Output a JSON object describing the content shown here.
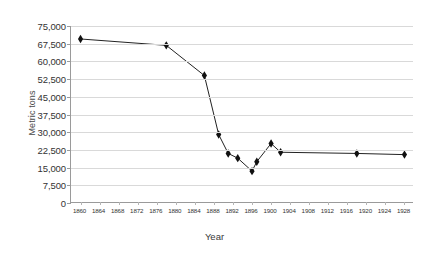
{
  "chart_data": {
    "type": "line",
    "title": "",
    "subtitle": "",
    "xlabel": "Year",
    "ylabel": "Metric tons",
    "xlim": [
      1858,
      1930
    ],
    "ylim": [
      0,
      75000
    ],
    "grid": true,
    "legend": false,
    "marker": "diamond",
    "line_color": "#222222",
    "marker_color": "#111111",
    "grid_color": "#d9d9d9",
    "axis_color": "#9a9a9a",
    "y_ticks": [
      0,
      7500,
      15000,
      22500,
      30000,
      37500,
      45000,
      52500,
      60000,
      67500,
      75000
    ],
    "y_tick_labels": [
      "0",
      "7,500",
      "15,000",
      "22,500",
      "30,000",
      "37,500",
      "45,000",
      "52,500",
      "60,000",
      "67,500",
      "75,000"
    ],
    "x_ticks": [
      1860,
      1864,
      1868,
      1872,
      1876,
      1880,
      1884,
      1888,
      1892,
      1896,
      1900,
      1904,
      1908,
      1912,
      1916,
      1920,
      1924,
      1928
    ],
    "x_tick_labels": [
      "1860",
      "1864",
      "1868",
      "1872",
      "1876",
      "1880",
      "1884",
      "1888",
      "1892",
      "1896",
      "1900",
      "1904",
      "1908",
      "1912",
      "1916",
      "1920",
      "1924",
      "1928"
    ],
    "x": [
      1860,
      1878,
      1886,
      1889,
      1891,
      1893,
      1896,
      1897,
      1900,
      1902,
      1918,
      1928
    ],
    "values": [
      69500,
      66800,
      54000,
      29000,
      21000,
      19000,
      13500,
      17500,
      25200,
      21500,
      21000,
      20500
    ],
    "points": [
      {
        "x": 1860,
        "y": 69500
      },
      {
        "x": 1878,
        "y": 66800
      },
      {
        "x": 1886,
        "y": 54000
      },
      {
        "x": 1889,
        "y": 29000
      },
      {
        "x": 1891,
        "y": 21000
      },
      {
        "x": 1893,
        "y": 19000
      },
      {
        "x": 1896,
        "y": 13500
      },
      {
        "x": 1897,
        "y": 17500
      },
      {
        "x": 1900,
        "y": 25200
      },
      {
        "x": 1902,
        "y": 21500
      },
      {
        "x": 1918,
        "y": 21000
      },
      {
        "x": 1928,
        "y": 20500
      }
    ]
  }
}
